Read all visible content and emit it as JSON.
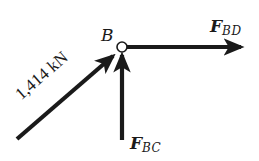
{
  "diagram": {
    "type": "free-body-diagram",
    "node": {
      "label": "B",
      "shape": "open-circle"
    },
    "forces": [
      {
        "id": "applied",
        "label": "1,414 kN",
        "direction": "up-right toward B (~41° above horizontal)"
      },
      {
        "id": "F_BC",
        "label_main": "F",
        "label_sub": "BC",
        "direction": "vertical upward into B"
      },
      {
        "id": "F_BD",
        "label_main": "F",
        "label_sub": "BD",
        "direction": "horizontal rightward away from B"
      }
    ],
    "colors": {
      "arrow": "#1a1a1a",
      "node_fill": "#ffffff",
      "background": "#ffffff"
    }
  }
}
